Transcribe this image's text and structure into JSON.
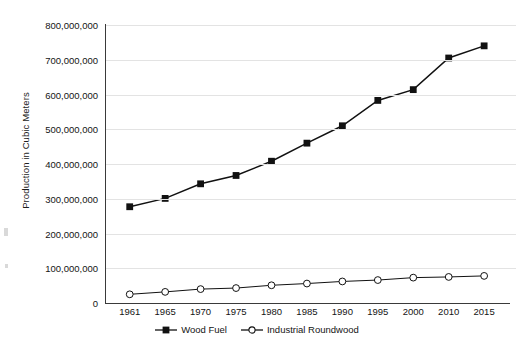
{
  "chart_data": {
    "type": "line",
    "title": "",
    "xlabel": "",
    "ylabel": "Production in Cubic Meters",
    "categories": [
      "1961",
      "1965",
      "1970",
      "1975",
      "1980",
      "1985",
      "1990",
      "1995",
      "2000",
      "2010",
      "2015"
    ],
    "ylim": [
      0,
      800000000
    ],
    "ytick_values": [
      0,
      100000000,
      200000000,
      300000000,
      400000000,
      500000000,
      600000000,
      700000000,
      800000000
    ],
    "ytick_labels": [
      "0",
      "100,000,000",
      "200,000,000",
      "300,000,000",
      "400,000,000",
      "500,000,000",
      "600,000,000",
      "700,000,000",
      "800,000,000"
    ],
    "grid": true,
    "legend_position": "bottom",
    "series": [
      {
        "name": "Wood Fuel",
        "marker": "filled-square",
        "color": "#111111",
        "values": [
          277000000,
          301000000,
          343000000,
          367000000,
          408000000,
          460000000,
          510000000,
          583000000,
          614000000,
          705000000,
          740000000
        ]
      },
      {
        "name": "Industrial Roundwood",
        "marker": "open-circle",
        "color": "#111111",
        "values": [
          25000000,
          32000000,
          40000000,
          43000000,
          51000000,
          56000000,
          62000000,
          66000000,
          73000000,
          75000000,
          78000000
        ]
      }
    ]
  },
  "legend": {
    "items": [
      {
        "label": "Wood Fuel"
      },
      {
        "label": "Industrial Roundwood"
      }
    ]
  }
}
